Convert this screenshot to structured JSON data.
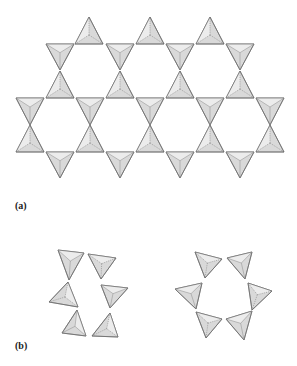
{
  "figure": {
    "panel_a_label": "(a)",
    "panel_b_label": "(b)",
    "colors": {
      "face": "#d9d9d9",
      "light_face": "#ececec",
      "edge": "#6a6a6a"
    }
  },
  "panel_a": {
    "description": "kagome sheet of corner-sharing tetrahedra",
    "half_width": 14,
    "rows": [
      {
        "orient": "up",
        "apex_y": 17,
        "base_y": 44,
        "cx": [
          89,
          150,
          210
        ]
      },
      {
        "orient": "down",
        "top_y": 44,
        "apex_y": 70,
        "cx": [
          60,
          120,
          180,
          240
        ]
      },
      {
        "orient": "up",
        "apex_y": 71,
        "base_y": 98,
        "cx": [
          60,
          120,
          180,
          240
        ]
      },
      {
        "orient": "down",
        "top_y": 98,
        "apex_y": 125,
        "cx": [
          30,
          90,
          150,
          210,
          270
        ]
      },
      {
        "orient": "up",
        "apex_y": 125,
        "base_y": 152,
        "cx": [
          30,
          90,
          150,
          210,
          270
        ]
      },
      {
        "orient": "down",
        "top_y": 152,
        "apex_y": 178,
        "cx": [
          60,
          120,
          180,
          240
        ]
      }
    ]
  },
  "panel_b": {
    "left_structure": "twisted chain of six tetrahedra",
    "right_structure": "six-membered ring of tetrahedra"
  }
}
